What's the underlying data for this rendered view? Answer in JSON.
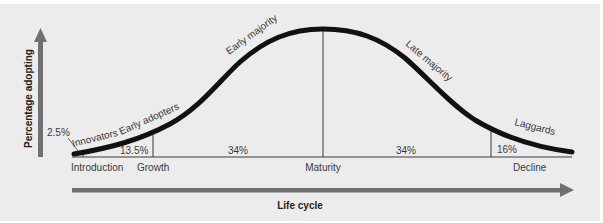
{
  "diagram": {
    "y_axis_label": "Percentage adopting",
    "x_axis_label": "Life cycle",
    "colors": {
      "background": "#ececec",
      "curve": "#111111",
      "axis_arrow": "#707070",
      "text": "#3a3a3a"
    },
    "segments": [
      {
        "name": "Innovators",
        "percent": "2.5%"
      },
      {
        "name": "Early adopters",
        "percent": "13.5%"
      },
      {
        "name": "Early majority",
        "percent": "34%"
      },
      {
        "name": "Late majority",
        "percent": "34%"
      },
      {
        "name": "Laggards",
        "percent": "16%"
      }
    ],
    "stages": [
      {
        "name": "Introduction"
      },
      {
        "name": "Growth"
      },
      {
        "name": "Maturity"
      },
      {
        "name": "Decline"
      }
    ]
  }
}
